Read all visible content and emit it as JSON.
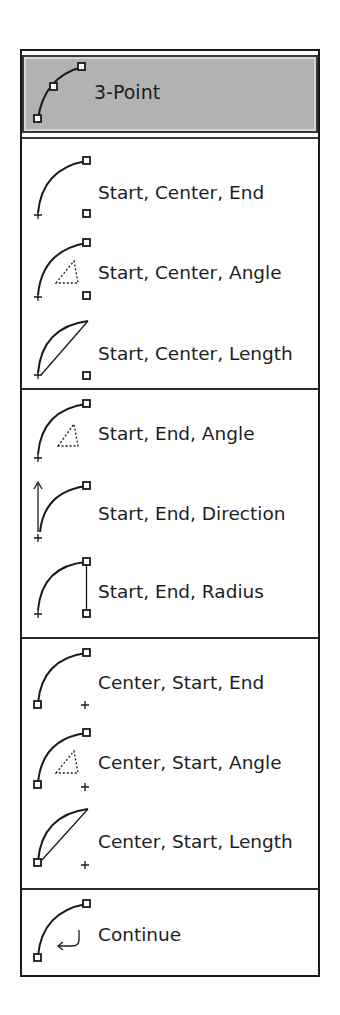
{
  "menu": {
    "selected": {
      "label": "3-Point",
      "icon": "arc-3point-icon"
    },
    "groups": [
      {
        "items": [
          {
            "label": "Start, Center, End",
            "icon": "arc-start-center-end-icon"
          },
          {
            "label": "Start, Center, Angle",
            "icon": "arc-start-center-angle-icon"
          },
          {
            "label": "Start, Center, Length",
            "icon": "arc-start-center-length-icon"
          }
        ]
      },
      {
        "items": [
          {
            "label": "Start, End, Angle",
            "icon": "arc-start-end-angle-icon"
          },
          {
            "label": "Start, End, Direction",
            "icon": "arc-start-end-direction-icon"
          },
          {
            "label": "Start, End, Radius",
            "icon": "arc-start-end-radius-icon"
          }
        ]
      },
      {
        "items": [
          {
            "label": "Center, Start, End",
            "icon": "arc-center-start-end-icon"
          },
          {
            "label": "Center, Start, Angle",
            "icon": "arc-center-start-angle-icon"
          },
          {
            "label": "Center, Start, Length",
            "icon": "arc-center-start-length-icon"
          }
        ]
      },
      {
        "items": [
          {
            "label": "Continue",
            "icon": "arc-continue-icon"
          }
        ]
      }
    ],
    "colors": {
      "highlight_bg": "#b2b2b2",
      "border": "#1a1a1a",
      "text": "#1e1e1e"
    }
  }
}
